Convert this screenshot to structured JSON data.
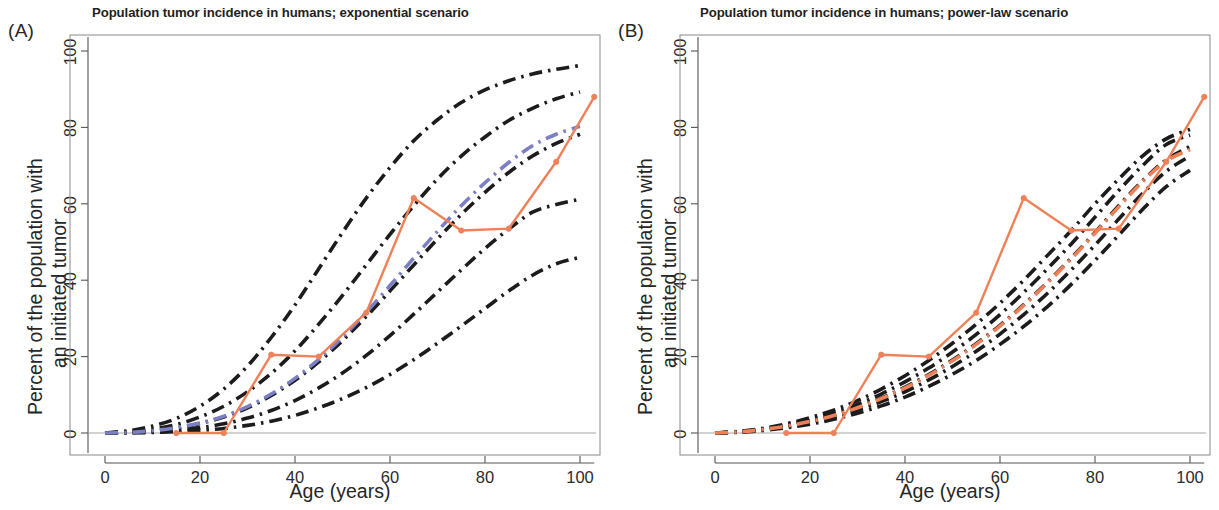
{
  "figure": {
    "panels": [
      {
        "id": "A",
        "letter": "(A)",
        "title": "Population tumor incidence in humans; exponential scenario",
        "xlabel": "Age (years)",
        "ylabel_line1": "Percent of the population with",
        "ylabel_line2": "an initiated tumor"
      },
      {
        "id": "B",
        "letter": "(B)",
        "title": "Population tumor incidence in humans; power-law scenario",
        "xlabel": "Age (years)",
        "ylabel_line1": "Percent of the population with",
        "ylabel_line2": "an initiated tumor"
      }
    ]
  },
  "colors": {
    "observed_orange": "#ef8159",
    "model_black": "#1c1c1c",
    "model_blue": "#7b7fc4",
    "axis": "#555555",
    "box": "#8a8a8a",
    "text": "#262626"
  },
  "chart_data": [
    {
      "type": "line",
      "panel": "A",
      "title": "Population tumor incidence in humans; exponential scenario",
      "xlabel": "Age (years)",
      "ylabel": "Percent of the population with an initiated tumor",
      "xlim": [
        -4,
        106
      ],
      "ylim": [
        -5,
        107
      ],
      "xticks": [
        0,
        20,
        40,
        60,
        80,
        100
      ],
      "yticks": [
        0,
        20,
        40,
        60,
        80,
        100
      ],
      "grid": false,
      "legend": "none",
      "x": [
        0,
        5,
        10,
        15,
        20,
        25,
        30,
        35,
        40,
        45,
        50,
        55,
        60,
        65,
        70,
        75,
        80,
        85,
        90,
        95,
        100
      ],
      "series": [
        {
          "name": "observed population incidence",
          "style": "solid-with-markers",
          "color": "#ef8159",
          "x": [
            15,
            25,
            35,
            45,
            55,
            65,
            75,
            85,
            95,
            103
          ],
          "values": [
            0,
            0,
            20.5,
            20,
            31.5,
            61.5,
            53,
            53.5,
            71,
            88
          ]
        },
        {
          "name": "exponential model curve 1 (highest)",
          "style": "dash-dot",
          "color": "#1c1c1c",
          "values": [
            0,
            0.6,
            1.8,
            3.8,
            7.0,
            11.5,
            17.5,
            25.0,
            33.5,
            43.0,
            52.5,
            61.5,
            69.5,
            76.5,
            82.0,
            86.5,
            89.8,
            92.2,
            94.0,
            95.2,
            96.2
          ]
        },
        {
          "name": "exponential model curve 2",
          "style": "dash-dot",
          "color": "#1c1c1c",
          "values": [
            0,
            0.3,
            1.0,
            2.2,
            4.2,
            7.0,
            10.8,
            15.6,
            21.5,
            28.5,
            36.0,
            44.0,
            52.0,
            59.5,
            66.5,
            72.5,
            77.5,
            81.8,
            85.0,
            87.5,
            89.3
          ]
        },
        {
          "name": "exponential model curve 3",
          "style": "dash-dot",
          "color": "#1c1c1c",
          "values": [
            0,
            0.15,
            0.6,
            1.3,
            2.5,
            4.2,
            6.6,
            9.8,
            13.8,
            18.6,
            24.2,
            30.5,
            37.2,
            44.0,
            50.8,
            57.2,
            63.0,
            68.2,
            72.5,
            75.8,
            78.2
          ]
        },
        {
          "name": "exponential model curve 4",
          "style": "dash-dot",
          "color": "#1c1c1c",
          "values": [
            0,
            0.08,
            0.3,
            0.7,
            1.4,
            2.4,
            3.9,
            5.9,
            8.5,
            11.8,
            15.7,
            20.3,
            25.5,
            31.1,
            36.9,
            42.7,
            48.3,
            53.4,
            57.8,
            59.8,
            61.2
          ]
        },
        {
          "name": "exponential model curve 5 (lowest)",
          "style": "dash-dot",
          "color": "#1c1c1c",
          "values": [
            0,
            0.04,
            0.15,
            0.35,
            0.7,
            1.2,
            2.0,
            3.1,
            4.6,
            6.6,
            9.0,
            11.9,
            15.3,
            19.2,
            23.5,
            28.0,
            32.6,
            37.2,
            41.3,
            44.3,
            46.0
          ]
        },
        {
          "name": "exponential model fit (blue)",
          "style": "dash-dot",
          "color": "#7b7fc4",
          "values": [
            0,
            0.15,
            0.6,
            1.4,
            2.6,
            4.4,
            6.9,
            10.2,
            14.3,
            19.3,
            25.1,
            31.6,
            38.6,
            45.8,
            52.8,
            59.5,
            65.5,
            70.8,
            75.2,
            78.2,
            80.3
          ]
        }
      ]
    },
    {
      "type": "line",
      "panel": "B",
      "title": "Population tumor incidence in humans; power-law scenario",
      "xlabel": "Age (years)",
      "ylabel": "Percent of the population with an initiated tumor",
      "xlim": [
        -4,
        106
      ],
      "ylim": [
        -5,
        107
      ],
      "xticks": [
        0,
        20,
        40,
        60,
        80,
        100
      ],
      "yticks": [
        0,
        20,
        40,
        60,
        80,
        100
      ],
      "grid": false,
      "legend": "none",
      "x": [
        0,
        5,
        10,
        15,
        20,
        25,
        30,
        35,
        40,
        45,
        50,
        55,
        60,
        65,
        70,
        75,
        80,
        85,
        90,
        95,
        100
      ],
      "series": [
        {
          "name": "observed population incidence",
          "style": "solid-with-markers",
          "color": "#ef8159",
          "x": [
            15,
            25,
            35,
            45,
            55,
            65,
            75,
            85,
            95,
            103
          ],
          "values": [
            0,
            0,
            20.5,
            20,
            31.5,
            61.5,
            53,
            53.5,
            71,
            88
          ]
        },
        {
          "name": "power-law model curve 1 (highest)",
          "style": "dash-dot",
          "color": "#1c1c1c",
          "values": [
            0,
            0.4,
            1.2,
            2.4,
            4.0,
            6.0,
            8.5,
            11.5,
            15.0,
            19.0,
            23.5,
            28.5,
            34.0,
            40.0,
            46.5,
            53.0,
            60.0,
            66.5,
            72.5,
            77.0,
            79.5
          ]
        },
        {
          "name": "power-law model curve 2",
          "style": "dash-dot",
          "color": "#1c1c1c",
          "values": [
            0,
            0.35,
            1.0,
            2.1,
            3.5,
            5.3,
            7.5,
            10.2,
            13.4,
            17.0,
            21.2,
            25.8,
            31.0,
            36.8,
            43.0,
            49.5,
            56.5,
            63.5,
            70.0,
            75.5,
            78.0
          ]
        },
        {
          "name": "power-law model curve 3",
          "style": "dash-dot",
          "color": "#1c1c1c",
          "values": [
            0,
            0.3,
            0.9,
            1.8,
            3.1,
            4.7,
            6.7,
            9.1,
            12.0,
            15.3,
            19.1,
            23.4,
            28.2,
            33.6,
            39.5,
            45.8,
            52.5,
            59.5,
            66.0,
            71.5,
            75.0
          ]
        },
        {
          "name": "power-law model curve 4",
          "style": "dash-dot",
          "color": "#1c1c1c",
          "values": [
            0,
            0.25,
            0.8,
            1.6,
            2.7,
            4.2,
            6.0,
            8.2,
            10.8,
            13.9,
            17.4,
            21.4,
            25.9,
            31.0,
            36.6,
            42.7,
            49.2,
            56.0,
            62.7,
            68.5,
            72.5
          ]
        },
        {
          "name": "power-law model curve 5 (lowest)",
          "style": "dash-dot",
          "color": "#1c1c1c",
          "values": [
            0,
            0.2,
            0.65,
            1.35,
            2.3,
            3.6,
            5.2,
            7.1,
            9.4,
            12.2,
            15.4,
            19.0,
            23.2,
            27.9,
            33.1,
            38.9,
            45.2,
            51.8,
            58.5,
            64.5,
            68.8
          ]
        },
        {
          "name": "power-law model fit (orange dash-dot)",
          "style": "dash-dot",
          "color": "#ef8159",
          "values": [
            0,
            0.3,
            0.9,
            1.8,
            3.0,
            4.6,
            6.6,
            9.0,
            11.8,
            15.1,
            18.9,
            23.2,
            28.0,
            33.4,
            39.3,
            45.6,
            52.3,
            59.2,
            65.8,
            71.2,
            74.2
          ]
        }
      ]
    }
  ]
}
